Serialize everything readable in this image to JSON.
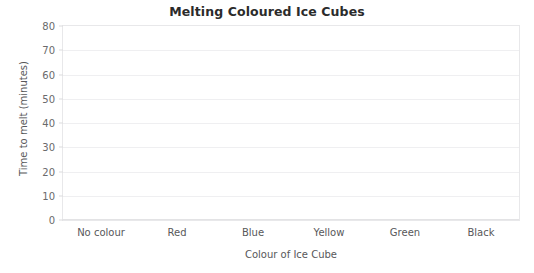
{
  "chart_data": {
    "type": "bar",
    "title": "Melting Coloured Ice Cubes",
    "xlabel": "Colour of Ice Cube",
    "ylabel": "Time to melt (minutes)",
    "categories": [
      "No colour",
      "Red",
      "Blue",
      "Yellow",
      "Green",
      "Black"
    ],
    "values": [
      null,
      null,
      null,
      null,
      null,
      null
    ],
    "series": [],
    "ylim": [
      0,
      80
    ],
    "ytick_step": 10,
    "yticks": [
      0,
      10,
      20,
      30,
      40,
      50,
      60,
      70,
      80
    ],
    "ytick_labels": [
      "0",
      "10",
      "20",
      "30",
      "40",
      "50",
      "60",
      "70",
      "80"
    ],
    "grid": true,
    "grid_axis": "y",
    "legend": false,
    "legend_position": "none",
    "empty": true,
    "note": "Blank axes template with no plotted data",
    "colors": {
      "background": "#ffffff",
      "plot_background": "#ffffff",
      "title_text": "#2b2b2b",
      "label_text": "#58585a",
      "tick_text": "#6a6a6c",
      "gridline": "#efeff1",
      "axis_border": "#e8e8ea"
    }
  }
}
